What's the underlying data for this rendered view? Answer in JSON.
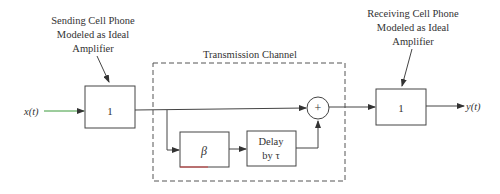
{
  "diagram": {
    "sending_label": [
      "Sending Cell Phone",
      "Modeled as Ideal",
      "Amplifier"
    ],
    "receiving_label": [
      "Receiving Cell Phone",
      "Modeled as Ideal",
      "Amplifier"
    ],
    "channel_title": "Transmission Channel",
    "input_signal": "x(t)",
    "output_signal": "y(t)",
    "sending_gain": "1",
    "receiving_gain": "1",
    "attenuation_block": "β",
    "delay_block": [
      "Delay",
      "by τ"
    ],
    "summer_symbol": "+"
  },
  "colors": {
    "line": "#444444",
    "input_arrow_accent": "#3a9a3a",
    "beta_underline_accent": "#d04040"
  }
}
